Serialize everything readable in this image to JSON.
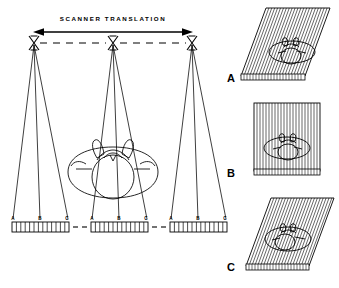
{
  "figure": {
    "title": "SCANNER TRANSLATION",
    "background_color": "#ffffff",
    "ink_color": "#000000"
  },
  "main_diagram": {
    "arrow": {
      "name": "scanner-translation-arrow",
      "style": "double-headed"
    },
    "dashed_track_label": "",
    "source_positions": [
      {
        "id": "left",
        "x": 34,
        "y": 40
      },
      {
        "id": "center",
        "x": 113,
        "y": 40
      },
      {
        "id": "right",
        "x": 192,
        "y": 40
      }
    ],
    "detector_arrays": [
      {
        "id": "left-array",
        "labels": [
          "A",
          "B",
          "C"
        ],
        "cells": 13
      },
      {
        "id": "center-array",
        "labels": [
          "A",
          "B",
          "C"
        ],
        "cells": 13
      },
      {
        "id": "right-array",
        "labels": [
          "A",
          "B",
          "C"
        ],
        "cells": 13
      }
    ],
    "subject": {
      "name": "head-cross-section",
      "description": "axial head outline"
    }
  },
  "panels": [
    {
      "label": "A",
      "skew": "left-leaning",
      "ray_count": 22,
      "has_detector_strip": true,
      "detector_cells": 22,
      "subject": "head-cross-section"
    },
    {
      "label": "B",
      "skew": "none",
      "ray_count": 22,
      "has_detector_strip": true,
      "detector_cells": 22,
      "subject": "head-cross-section"
    },
    {
      "label": "C",
      "skew": "left-leaning",
      "ray_count": 22,
      "has_detector_strip": true,
      "detector_cells": 22,
      "subject": "head-cross-section"
    }
  ]
}
